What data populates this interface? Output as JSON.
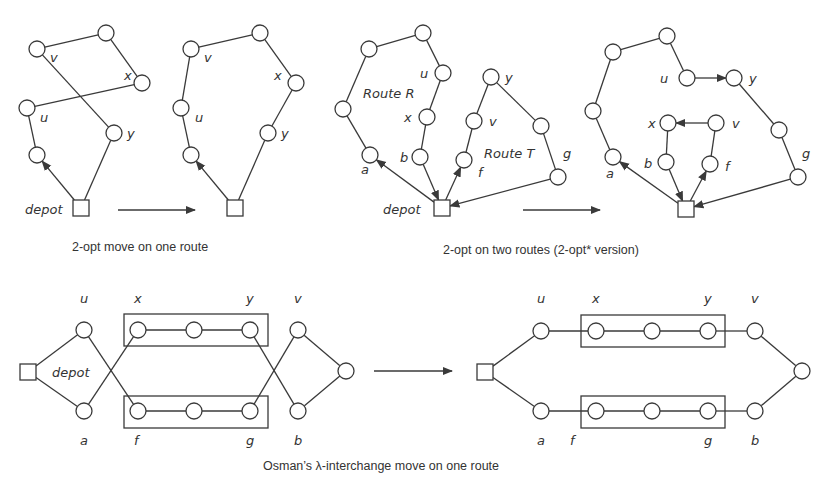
{
  "colors": {
    "ink": "#3a3a3a",
    "text": "#333333",
    "background": "#ffffff"
  },
  "captions": {
    "two_opt": "2-opt move on one route",
    "two_opt_star": "2-opt on two routes (2-opt* version)",
    "lambda": "Osman’s λ-interchange move on one route"
  },
  "labels": {
    "depot": "depot",
    "route_r": "Route R",
    "route_t": "Route T"
  },
  "panels": [
    {
      "id": "two-opt-before",
      "depot": [
        81,
        208
      ],
      "nodes": [
        [
          37,
          49
        ],
        [
          106,
          33
        ],
        [
          142,
          83
        ],
        [
          27,
          108
        ],
        [
          114,
          133
        ],
        [
          37,
          155
        ]
      ],
      "edges": [
        [
          0,
          1
        ],
        [
          1,
          2
        ],
        [
          2,
          3
        ],
        [
          0,
          4
        ],
        [
          3,
          5
        ]
      ],
      "depot_edges": [
        {
          "to": 4,
          "arrow": false
        },
        {
          "to": 5,
          "arrow": true,
          "dir": "out"
        }
      ],
      "node_labels": [
        {
          "t": "v",
          "x": 50,
          "y": 62
        },
        {
          "t": "x",
          "x": 124,
          "y": 80
        },
        {
          "t": "u",
          "x": 40,
          "y": 122
        },
        {
          "t": "y",
          "x": 127,
          "y": 138
        }
      ],
      "depot_label": {
        "x": 25,
        "y": 214
      }
    },
    {
      "id": "two-opt-after",
      "depot": [
        235,
        208
      ],
      "nodes": [
        [
          191,
          49
        ],
        [
          260,
          33
        ],
        [
          296,
          83
        ],
        [
          181,
          108
        ],
        [
          268,
          133
        ],
        [
          191,
          155
        ]
      ],
      "edges": [
        [
          0,
          1
        ],
        [
          1,
          2
        ],
        [
          2,
          4
        ],
        [
          0,
          3
        ],
        [
          3,
          5
        ]
      ],
      "depot_edges": [
        {
          "to": 4,
          "arrow": false
        },
        {
          "to": 5,
          "arrow": true,
          "dir": "out"
        }
      ],
      "node_labels": [
        {
          "t": "v",
          "x": 204,
          "y": 62
        },
        {
          "t": "x",
          "x": 274,
          "y": 80
        },
        {
          "t": "u",
          "x": 195,
          "y": 122
        },
        {
          "t": "y",
          "x": 281,
          "y": 138
        }
      ]
    },
    {
      "id": "two-opt-star-before",
      "depot": [
        442,
        208
      ],
      "nodes": [
        [
          369,
          49
        ],
        [
          423,
          33
        ],
        [
          443,
          73
        ],
        [
          343,
          109
        ],
        [
          427,
          117
        ],
        [
          420,
          157
        ],
        [
          370,
          155
        ],
        [
          491,
          77
        ],
        [
          474,
          121
        ],
        [
          464,
          160
        ],
        [
          541,
          126
        ],
        [
          558,
          177
        ]
      ],
      "edges": [
        [
          0,
          1
        ],
        [
          1,
          2
        ],
        [
          2,
          4
        ],
        [
          4,
          5
        ],
        [
          0,
          3
        ],
        [
          3,
          6
        ],
        [
          7,
          8
        ],
        [
          8,
          9
        ],
        [
          7,
          10
        ],
        [
          10,
          11
        ]
      ],
      "depot_edges": [
        {
          "to": 6,
          "arrow": true,
          "dir": "out"
        },
        {
          "to": 5,
          "arrow": true,
          "dir": "in"
        },
        {
          "to": 9,
          "arrow": true,
          "dir": "out"
        },
        {
          "to": 11,
          "arrow": true,
          "dir": "in"
        }
      ],
      "node_labels": [
        {
          "t": "u",
          "x": 420,
          "y": 78
        },
        {
          "t": "x",
          "x": 404,
          "y": 122
        },
        {
          "t": "b",
          "x": 400,
          "y": 162
        },
        {
          "t": "a",
          "x": 361,
          "y": 174
        },
        {
          "t": "y",
          "x": 505,
          "y": 82
        },
        {
          "t": "v",
          "x": 489,
          "y": 126
        },
        {
          "t": "f",
          "x": 478,
          "y": 177
        },
        {
          "t": "g",
          "x": 563,
          "y": 158
        }
      ],
      "depot_label": {
        "x": 383,
        "y": 214
      },
      "route_labels": [
        {
          "key": "route_r",
          "x": 363,
          "y": 98
        },
        {
          "key": "route_t",
          "x": 484,
          "y": 158
        }
      ]
    },
    {
      "id": "two-opt-star-after",
      "depot": [
        686,
        209
      ],
      "nodes": [
        [
          613,
          52
        ],
        [
          667,
          36
        ],
        [
          687,
          78
        ],
        [
          734,
          78
        ],
        [
          593,
          111
        ],
        [
          668,
          123
        ],
        [
          716,
          123
        ],
        [
          613,
          157
        ],
        [
          666,
          162
        ],
        [
          710,
          164
        ],
        [
          779,
          130
        ],
        [
          798,
          177
        ]
      ],
      "edges": [
        [
          0,
          1
        ],
        [
          1,
          2
        ],
        [
          0,
          4
        ],
        [
          4,
          7
        ],
        [
          5,
          8
        ],
        [
          6,
          9
        ],
        [
          3,
          10
        ],
        [
          10,
          11
        ]
      ],
      "arrow_edges": [
        [
          2,
          3
        ],
        [
          6,
          5
        ]
      ],
      "depot_edges": [
        {
          "to": 7,
          "arrow": true,
          "dir": "out"
        },
        {
          "to": 8,
          "arrow": true,
          "dir": "in"
        },
        {
          "to": 9,
          "arrow": true,
          "dir": "out"
        },
        {
          "to": 11,
          "arrow": true,
          "dir": "in"
        }
      ],
      "node_labels": [
        {
          "t": "u",
          "x": 660,
          "y": 83
        },
        {
          "t": "y",
          "x": 749,
          "y": 83
        },
        {
          "t": "x",
          "x": 648,
          "y": 128
        },
        {
          "t": "v",
          "x": 732,
          "y": 128
        },
        {
          "t": "b",
          "x": 644,
          "y": 168
        },
        {
          "t": "f",
          "x": 725,
          "y": 171
        },
        {
          "t": "a",
          "x": 606,
          "y": 178
        },
        {
          "t": "g",
          "x": 802,
          "y": 158
        }
      ]
    },
    {
      "id": "lambda-before",
      "depot": [
        28,
        372
      ],
      "nodes": [
        [
          84,
          330
        ],
        [
          84,
          411
        ],
        [
          138,
          330
        ],
        [
          194,
          330
        ],
        [
          250,
          330
        ],
        [
          138,
          411
        ],
        [
          194,
          411
        ],
        [
          250,
          411
        ],
        [
          298,
          330
        ],
        [
          298,
          411
        ],
        [
          346,
          371
        ]
      ],
      "edges": [
        [
          2,
          3
        ],
        [
          3,
          4
        ],
        [
          5,
          6
        ],
        [
          6,
          7
        ],
        [
          0,
          5
        ],
        [
          1,
          2
        ],
        [
          4,
          9
        ],
        [
          7,
          8
        ],
        [
          8,
          10
        ],
        [
          9,
          10
        ]
      ],
      "depot_edges": [
        {
          "to": 0,
          "arrow": false
        },
        {
          "to": 1,
          "arrow": false
        }
      ],
      "boxes": [
        [
          124,
          314,
          144,
          32
        ],
        [
          124,
          396,
          144,
          32
        ]
      ],
      "node_labels": [
        {
          "t": "u",
          "x": 80,
          "y": 303
        },
        {
          "t": "x",
          "x": 134,
          "y": 303
        },
        {
          "t": "y",
          "x": 246,
          "y": 303
        },
        {
          "t": "v",
          "x": 294,
          "y": 303
        },
        {
          "t": "a",
          "x": 80,
          "y": 445
        },
        {
          "t": "f",
          "x": 134,
          "y": 445
        },
        {
          "t": "g",
          "x": 246,
          "y": 445
        },
        {
          "t": "b",
          "x": 294,
          "y": 445
        }
      ],
      "depot_label": {
        "x": 52,
        "y": 377
      }
    },
    {
      "id": "lambda-after",
      "depot": [
        485,
        372
      ],
      "nodes": [
        [
          541,
          331
        ],
        [
          541,
          411
        ],
        [
          596,
          331
        ],
        [
          652,
          331
        ],
        [
          708,
          331
        ],
        [
          596,
          411
        ],
        [
          652,
          411
        ],
        [
          708,
          411
        ],
        [
          755,
          331
        ],
        [
          755,
          411
        ],
        [
          802,
          371
        ]
      ],
      "edges": [
        [
          0,
          2
        ],
        [
          2,
          3
        ],
        [
          3,
          4
        ],
        [
          4,
          8
        ],
        [
          1,
          5
        ],
        [
          5,
          6
        ],
        [
          6,
          7
        ],
        [
          7,
          9
        ],
        [
          8,
          10
        ],
        [
          9,
          10
        ]
      ],
      "depot_edges": [
        {
          "to": 0,
          "arrow": false
        },
        {
          "to": 1,
          "arrow": false
        }
      ],
      "boxes": [
        [
          581,
          315,
          144,
          32
        ],
        [
          581,
          396,
          144,
          32
        ]
      ],
      "node_labels": [
        {
          "t": "u",
          "x": 537,
          "y": 303
        },
        {
          "t": "x",
          "x": 592,
          "y": 303
        },
        {
          "t": "y",
          "x": 704,
          "y": 303
        },
        {
          "t": "v",
          "x": 751,
          "y": 303
        },
        {
          "t": "a",
          "x": 537,
          "y": 445
        },
        {
          "t": "f",
          "x": 570,
          "y": 445
        },
        {
          "t": "g",
          "x": 704,
          "y": 445
        },
        {
          "t": "b",
          "x": 751,
          "y": 445
        }
      ]
    }
  ],
  "transition_arrows": [
    {
      "x1": 118,
      "y1": 210,
      "x2": 195,
      "y2": 210
    },
    {
      "x1": 523,
      "y1": 210,
      "x2": 600,
      "y2": 210
    },
    {
      "x1": 374,
      "y1": 371,
      "x2": 452,
      "y2": 371
    }
  ],
  "caption_positions": {
    "two_opt": {
      "x": 72,
      "y": 251
    },
    "two_opt_star": {
      "x": 443,
      "y": 254
    },
    "lambda": {
      "x": 263,
      "y": 470
    }
  }
}
